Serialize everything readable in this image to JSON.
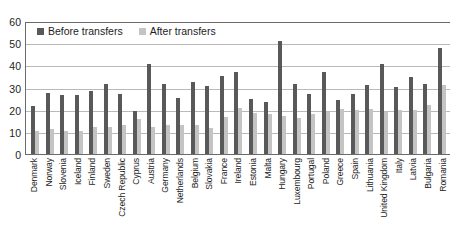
{
  "chart_data": {
    "type": "bar",
    "title": "",
    "xlabel": "",
    "ylabel": "",
    "ylim": [
      0,
      60
    ],
    "yticks": [
      0,
      10,
      20,
      30,
      40,
      50,
      60
    ],
    "grid": true,
    "legend_position": "top-left",
    "categories": [
      "Denmark",
      "Norway",
      "Slovenia",
      "Iceland",
      "Finland",
      "Sweden",
      "Czech Republic",
      "Cyprus",
      "Austria",
      "Germany",
      "Netherlands",
      "Belgium",
      "Slovakia",
      "France",
      "Ireland",
      "Estonia",
      "Malta",
      "Hungary",
      "Luxembourg",
      "Portugal",
      "Poland",
      "Greece",
      "Spain",
      "Lithuania",
      "United Kingdom",
      "Italy",
      "Latvia",
      "Bulgaria",
      "Romania"
    ],
    "series": [
      {
        "name": "Before transfers",
        "color": "#595959",
        "values": [
          21.8,
          27.5,
          26.4,
          26.7,
          28.6,
          31.4,
          27.2,
          19.6,
          40.6,
          31.4,
          25.1,
          32.5,
          30.9,
          35.4,
          37.0,
          24.8,
          23.3,
          51.2,
          31.5,
          27.3,
          36.8,
          24.2,
          27.3,
          31.2,
          40.8,
          30.4,
          34.6,
          31.4,
          47.9
        ]
      },
      {
        "name": "After transfers",
        "color": "#c4c4c4",
        "values": [
          10.4,
          11.1,
          10.5,
          10.6,
          12.0,
          12.4,
          13.0,
          15.9,
          12.2,
          13.2,
          13.0,
          13.2,
          11.8,
          16.6,
          20.9,
          18.4,
          18.2,
          17.3,
          16.1,
          18.0,
          19.0,
          20.1,
          19.9,
          20.3,
          18.8,
          19.8,
          20.0,
          22.0,
          31.2
        ]
      }
    ]
  },
  "legend": {
    "before_label": "Before transfers",
    "after_label": "After transfers"
  }
}
